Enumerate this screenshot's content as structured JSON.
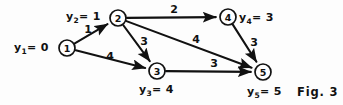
{
  "figure": {
    "caption": "Fig. 3",
    "background_color": "#fdfdfd",
    "ink_color": "#111111"
  },
  "chart_data": {
    "type": "diagram",
    "title": "Fig. 3",
    "nodes": [
      {
        "id": "1",
        "label": "1",
        "x": 67,
        "y": 48,
        "r": 8,
        "potential_name": "y",
        "potential_sub": "1",
        "potential_value": "0",
        "potential_text": "y1= 0",
        "label_side": "left"
      },
      {
        "id": "2",
        "label": "2",
        "x": 118,
        "y": 18,
        "r": 8,
        "potential_name": "y",
        "potential_sub": "2",
        "potential_value": "1",
        "potential_text": "y2= 1",
        "label_side": "left"
      },
      {
        "id": "3",
        "label": "3",
        "x": 157,
        "y": 71,
        "r": 8,
        "potential_name": "y",
        "potential_sub": "3",
        "potential_value": "4",
        "potential_text": "y3= 4",
        "label_side": "below"
      },
      {
        "id": "4",
        "label": "4",
        "x": 228,
        "y": 17,
        "r": 8,
        "potential_name": "y",
        "potential_sub": "4",
        "potential_value": "3",
        "potential_text": "y4= 3",
        "label_side": "right"
      },
      {
        "id": "5",
        "label": "5",
        "x": 263,
        "y": 72,
        "r": 8,
        "potential_name": "y",
        "potential_sub": "5",
        "potential_value": "5",
        "potential_text": "y5= 5",
        "label_side": "below"
      }
    ],
    "edges": [
      {
        "from": "1",
        "to": "2",
        "weight": "1",
        "wx": 88,
        "wy": 29
      },
      {
        "from": "1",
        "to": "3",
        "weight": "4",
        "wx": 110,
        "wy": 56
      },
      {
        "from": "2",
        "to": "3",
        "weight": "3",
        "wx": 144,
        "wy": 41
      },
      {
        "from": "2",
        "to": "4",
        "weight": "2",
        "wx": 174,
        "wy": 9
      },
      {
        "from": "2",
        "to": "5",
        "weight": "4",
        "wx": 196,
        "wy": 39
      },
      {
        "from": "3",
        "to": "5",
        "weight": "3",
        "wx": 214,
        "wy": 63
      },
      {
        "from": "4",
        "to": "5",
        "weight": "3",
        "wx": 254,
        "wy": 42
      }
    ],
    "node_potentials": {
      "1": 0,
      "2": 1,
      "3": 4,
      "4": 3,
      "5": 5
    },
    "edge_weights": {
      "1-2": 1,
      "1-3": 4,
      "2-3": 3,
      "2-4": 2,
      "2-5": 4,
      "3-5": 3,
      "4-5": 3
    }
  },
  "labels": {
    "y1": {
      "sym": "y",
      "sub": "1",
      "eq": "= 0",
      "x": 14,
      "y": 41
    },
    "y2": {
      "sym": "y",
      "sub": "2",
      "eq": "= 1",
      "x": 66,
      "y": 10
    },
    "y3": {
      "sym": "y",
      "sub": "3",
      "eq": "= 4",
      "x": 139,
      "y": 83
    },
    "y4": {
      "sym": "y",
      "sub": "4",
      "eq": "= 3",
      "x": 239,
      "y": 11
    },
    "y5": {
      "sym": "y",
      "sub": "5",
      "eq": "= 5",
      "x": 247,
      "y": 85
    },
    "caption": {
      "text": "Fig. 3",
      "x": 297,
      "y": 85
    }
  }
}
